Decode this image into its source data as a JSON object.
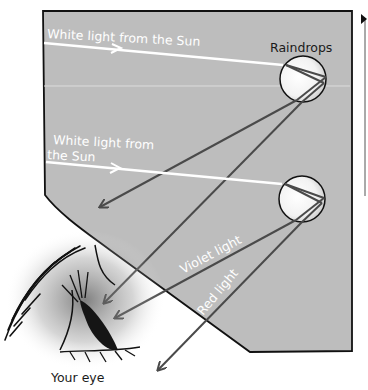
{
  "diagram": {
    "labels": {
      "sunlight_top": "White light from the Sun",
      "raindrops": "Raindrops",
      "sunlight_mid_line1": "White light from",
      "sunlight_mid_line2": "the Sun",
      "violet": "Violet light",
      "red": "Red light",
      "eye": "Your eye"
    },
    "colors": {
      "sky_panel": "#bdbdbd",
      "ray_white": "#ffffff",
      "ray_dark": "#4a4a4a",
      "outline": "#111111"
    }
  }
}
